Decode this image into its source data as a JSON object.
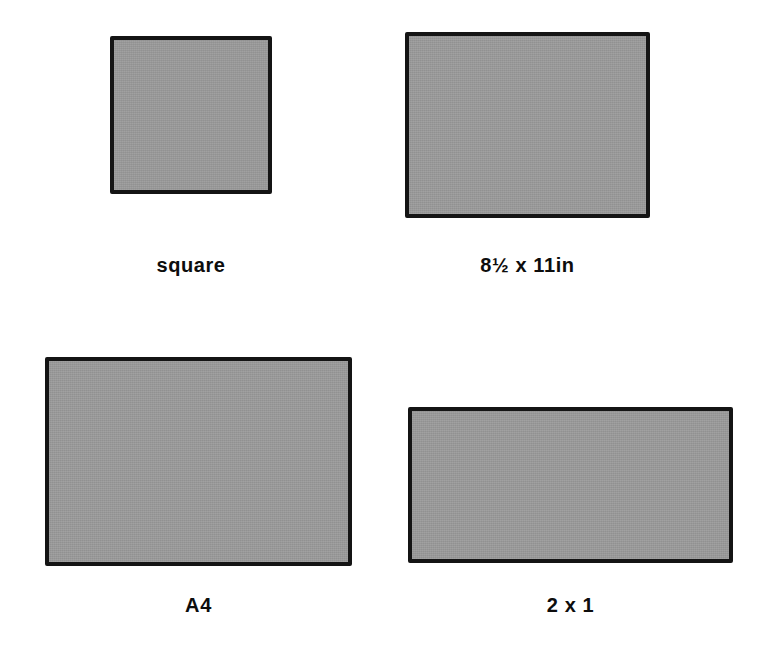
{
  "figure": {
    "background_color": "#ffffff",
    "fill_color": "#9a9a9a",
    "stroke_color": "#141414",
    "label_color": "#0d0d0d"
  },
  "shapes": [
    {
      "id": "square",
      "label": "square",
      "x": 110,
      "y": 36,
      "width": 162,
      "height": 158,
      "label_x": 110,
      "label_y": 255,
      "label_width": 162
    },
    {
      "id": "letter",
      "label": "8½ x 11in",
      "x": 405,
      "y": 32,
      "width": 245,
      "height": 186,
      "label_x": 405,
      "label_y": 255,
      "label_width": 245
    },
    {
      "id": "a4",
      "label": "A4",
      "x": 45,
      "y": 357,
      "width": 307,
      "height": 209,
      "label_x": 45,
      "label_y": 595,
      "label_width": 307
    },
    {
      "id": "two-by-one",
      "label": "2 x 1",
      "x": 408,
      "y": 407,
      "width": 325,
      "height": 156,
      "label_x": 408,
      "label_y": 595,
      "label_width": 325
    }
  ],
  "chart_data": {
    "type": "table",
    "columns": [
      "format",
      "label",
      "width_px",
      "height_px",
      "aspect_ratio"
    ],
    "rows": [
      [
        "square",
        "square",
        162,
        158,
        "1.03 : 1"
      ],
      [
        "letter",
        "8½ x 11in",
        245,
        186,
        "1.32 : 1"
      ],
      [
        "a4",
        "A4",
        307,
        209,
        "1.47 : 1"
      ],
      [
        "two-by-one",
        "2 x 1",
        325,
        156,
        "2.08 : 1"
      ]
    ]
  }
}
